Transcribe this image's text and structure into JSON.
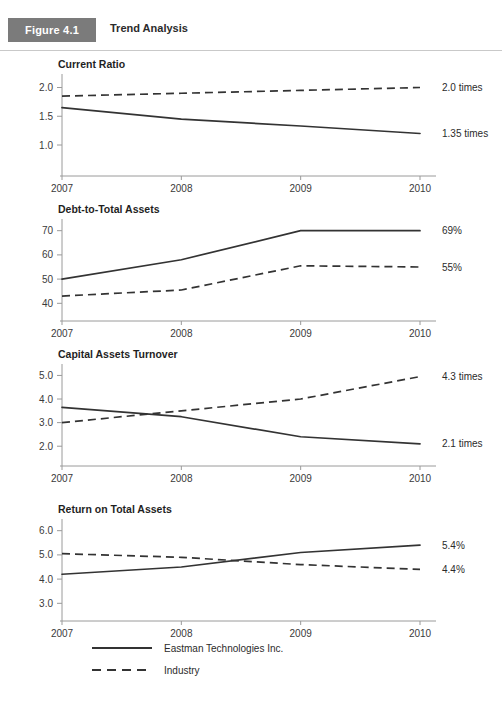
{
  "header": {
    "badge_label": "Figure 4.1",
    "title": "Trend Analysis"
  },
  "legend": {
    "items": [
      {
        "label": "Eastman Technologies Inc.",
        "style": "solid"
      },
      {
        "label": "Industry",
        "style": "dashed"
      }
    ]
  },
  "colors": {
    "badge_background": "#7b7b7b",
    "badge_text": "#ffffff",
    "line": "#333333",
    "axis": "#9a9a9a",
    "rule": "#c9c9c9",
    "text": "#2b2b2b"
  },
  "chart_data": [
    {
      "type": "line",
      "title": "Current Ratio",
      "xlabel": "",
      "ylabel": "",
      "x": [
        "2007",
        "2008",
        "2009",
        "2010"
      ],
      "ylim": [
        0.6,
        2.2
      ],
      "yticks": [
        1.0,
        1.5,
        2.0
      ],
      "ytick_labels": [
        "1.0",
        "1.5",
        "2.0"
      ],
      "grid": false,
      "legend_position": "bottom",
      "series": [
        {
          "name": "Eastman Technologies Inc.",
          "style": "solid",
          "values": [
            1.65,
            1.45,
            1.33,
            1.2
          ],
          "end_label": "1.35 times"
        },
        {
          "name": "Industry",
          "style": "dashed",
          "values": [
            1.85,
            1.9,
            1.95,
            2.0
          ],
          "end_label": "2.0 times"
        }
      ]
    },
    {
      "type": "line",
      "title": "Debt-to-Total Assets",
      "xlabel": "",
      "ylabel": "",
      "x": [
        "2007",
        "2008",
        "2009",
        "2010"
      ],
      "ylim": [
        36,
        74
      ],
      "yticks": [
        40,
        50,
        60,
        70
      ],
      "ytick_labels": [
        "40",
        "50",
        "60",
        "70"
      ],
      "grid": false,
      "legend_position": "bottom",
      "series": [
        {
          "name": "Eastman Technologies Inc.",
          "style": "solid",
          "values": [
            50,
            58,
            70,
            70
          ],
          "end_label": "69%"
        },
        {
          "name": "Industry",
          "style": "dashed",
          "values": [
            43,
            45.5,
            55.5,
            55
          ],
          "end_label": "55%"
        }
      ]
    },
    {
      "type": "line",
      "title": "Capital Assets Turnover",
      "xlabel": "",
      "ylabel": "",
      "x": [
        "2007",
        "2008",
        "2009",
        "2010"
      ],
      "ylim": [
        1.5,
        5.4
      ],
      "yticks": [
        2.0,
        3.0,
        4.0,
        5.0
      ],
      "ytick_labels": [
        "2.0",
        "3.0",
        "4.0",
        "5.0"
      ],
      "grid": false,
      "legend_position": "bottom",
      "series": [
        {
          "name": "Eastman Technologies Inc.",
          "style": "solid",
          "values": [
            3.65,
            3.25,
            2.4,
            2.1
          ],
          "end_label": "2.1 times"
        },
        {
          "name": "Industry",
          "style": "dashed",
          "values": [
            3.0,
            3.5,
            4.0,
            4.95
          ],
          "end_label": "4.3 times"
        }
      ]
    },
    {
      "type": "line",
      "title": "Return on Total Assets",
      "xlabel": "",
      "ylabel": "",
      "x": [
        "2007",
        "2008",
        "2009",
        "2010"
      ],
      "ylim": [
        2.6,
        6.4
      ],
      "yticks": [
        3.0,
        4.0,
        5.0,
        6.0
      ],
      "ytick_labels": [
        "3.0",
        "4.0",
        "5.0",
        "6.0"
      ],
      "grid": false,
      "legend_position": "bottom",
      "series": [
        {
          "name": "Eastman Technologies Inc.",
          "style": "solid",
          "values": [
            4.2,
            4.5,
            5.1,
            5.4
          ],
          "end_label": "5.4%"
        },
        {
          "name": "Industry",
          "style": "dashed",
          "values": [
            5.05,
            4.9,
            4.6,
            4.4
          ],
          "end_label": "4.4%"
        }
      ]
    }
  ]
}
